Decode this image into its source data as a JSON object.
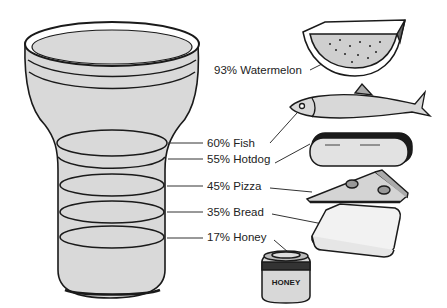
{
  "diagram": {
    "colors": {
      "glass_fill": "#d9d9d9",
      "outline": "#1a1a1a",
      "label_text": "#222222",
      "leader": "#333333"
    },
    "items": [
      {
        "percent": "93%",
        "food": "Watermelon",
        "label": "93% Watermelon",
        "icon": "watermelon-slice-icon"
      },
      {
        "percent": "60%",
        "food": "Fish",
        "label": "60% Fish",
        "icon": "fish-icon"
      },
      {
        "percent": "55%",
        "food": "Hotdog",
        "label": "55% Hotdog",
        "icon": "hotdog-icon"
      },
      {
        "percent": "45%",
        "food": "Pizza",
        "label": "45% Pizza",
        "icon": "pizza-slice-icon"
      },
      {
        "percent": "35%",
        "food": "Bread",
        "label": "35% Bread",
        "icon": "bread-slice-icon"
      },
      {
        "percent": "17%",
        "food": "Honey",
        "label": "17% Honey",
        "icon": "honey-jar-icon"
      }
    ],
    "honey_jar_text": "HONEY"
  }
}
